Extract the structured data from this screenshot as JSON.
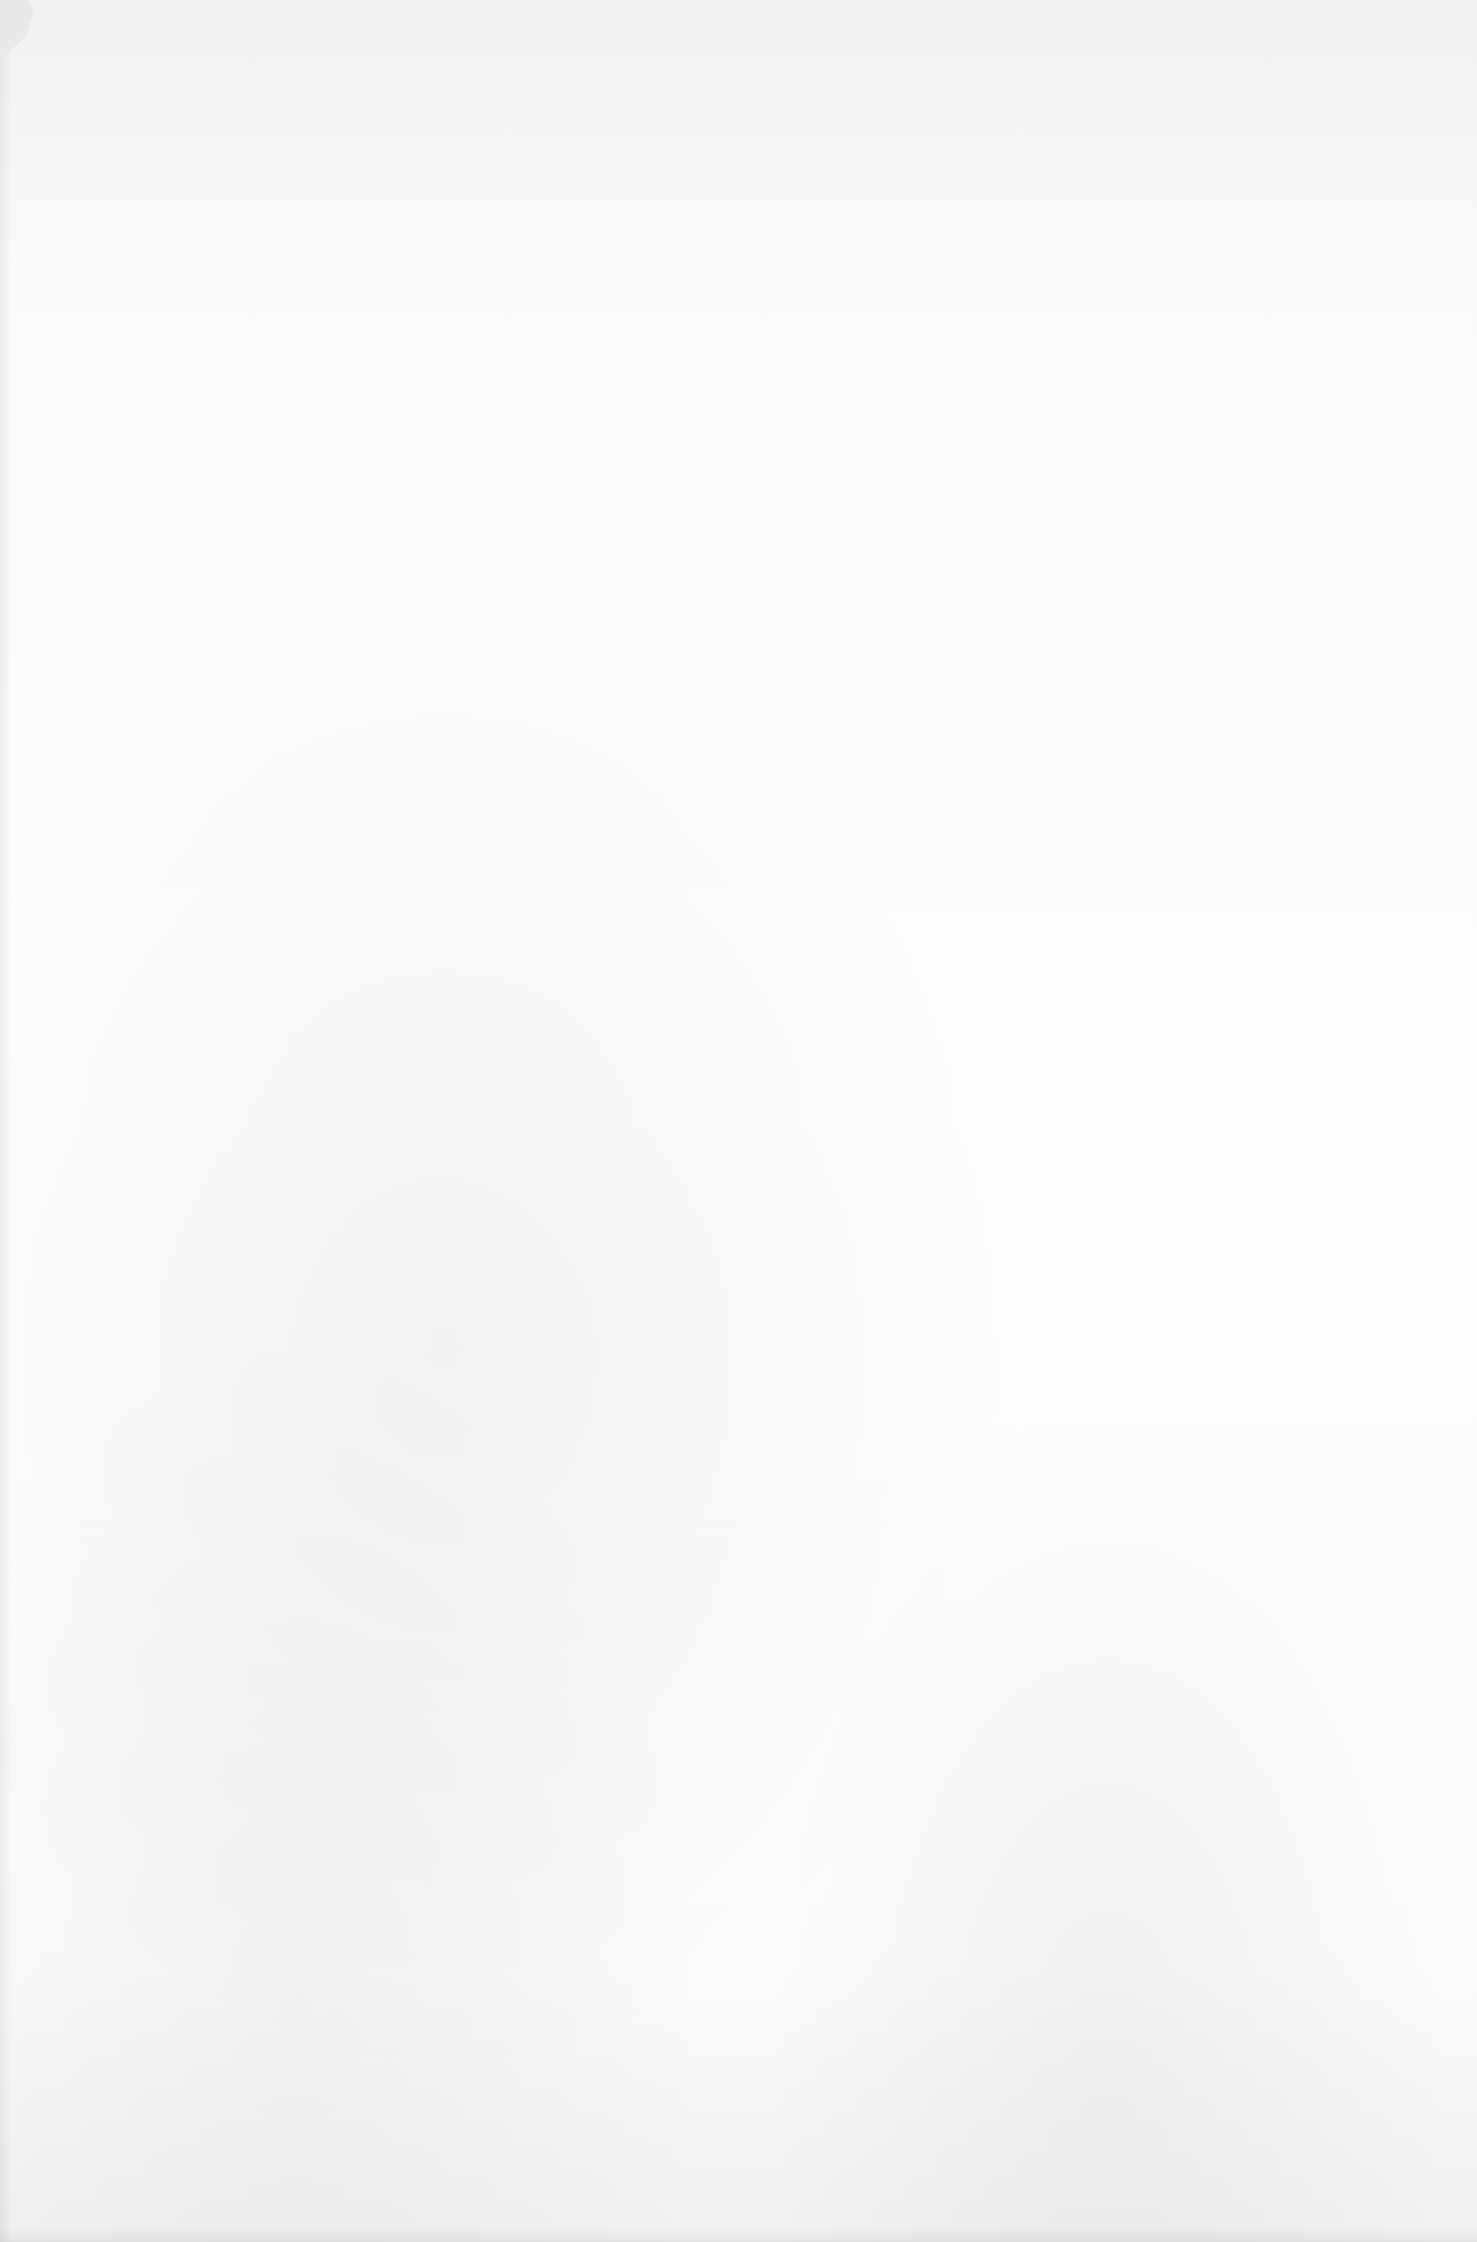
{
  "document": {
    "type": "blank-scanned-page",
    "paper_color": "#fdfdfd",
    "content": []
  }
}
